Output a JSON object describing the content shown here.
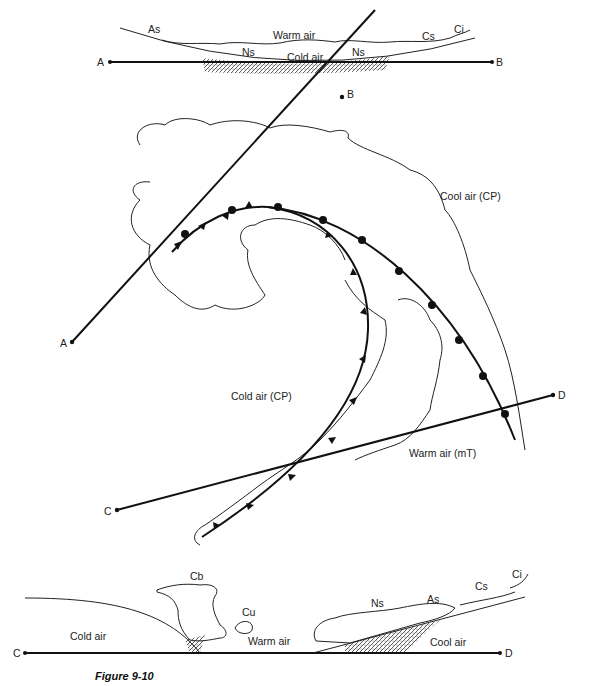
{
  "figure": {
    "caption": "Figure 9-10",
    "top_cross_section": {
      "endpoints": [
        "A",
        "B"
      ],
      "labels": {
        "warm_air": "Warm air",
        "cold_air": "Cold air",
        "as": "As",
        "ns_left": "Ns",
        "ns_right": "Ns",
        "cs": "Cs",
        "ci": "Ci"
      }
    },
    "map_view": {
      "line_ab": {
        "start": "A",
        "end": "B"
      },
      "line_cd": {
        "start": "C",
        "end": "D"
      },
      "labels": {
        "cool_air": "Cool air (CP)",
        "cold_air": "Cold air (CP)",
        "warm_air": "Warm air (mT)"
      },
      "fronts": [
        "occluded",
        "cold",
        "warm"
      ]
    },
    "bottom_cross_section": {
      "endpoints": [
        "C",
        "D"
      ],
      "labels": {
        "cold_air": "Cold air",
        "warm_air": "Warm air",
        "cool_air": "Cool air",
        "cb": "Cb",
        "cu": "Cu",
        "ns": "Ns",
        "as": "As",
        "cs": "Cs",
        "ci": "Ci"
      }
    }
  }
}
